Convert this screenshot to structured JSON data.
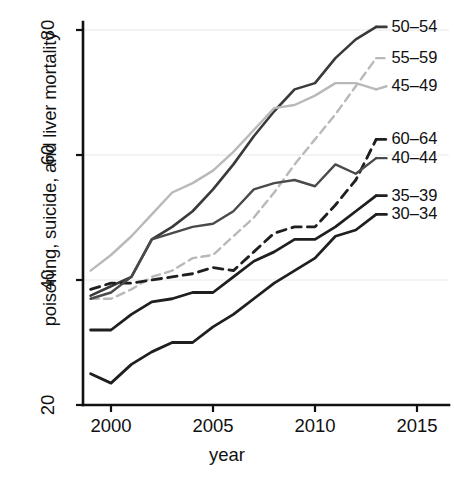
{
  "chart_data": {
    "type": "line",
    "title": "",
    "xlabel": "year",
    "ylabel": "poisoning, suicide, and liver mortality",
    "xlim": [
      1998.6,
      2015
    ],
    "ylim": [
      20,
      82
    ],
    "xticks": [
      2000,
      2005,
      2010,
      2015
    ],
    "yticks": [
      20,
      40,
      60,
      80
    ],
    "grid": true,
    "grid_color": "#e8e8e8",
    "legend_position": "right-end-of-line",
    "x": [
      1999,
      2000,
      2001,
      2002,
      2003,
      2004,
      2005,
      2006,
      2007,
      2008,
      2009,
      2010,
      2011,
      2012,
      2013
    ],
    "series": [
      {
        "name": "50-54",
        "label": "50–54",
        "color": "#3a3a3a",
        "style": "solid",
        "width": 2.6,
        "label_x": 2013.6,
        "label_y": 80.5,
        "values": [
          37.5,
          39.0,
          40.5,
          46.5,
          48.5,
          51.0,
          54.5,
          58.5,
          63.0,
          67.0,
          70.5,
          71.5,
          75.5,
          78.5,
          80.5
        ]
      },
      {
        "name": "55-59",
        "label": "55–59",
        "color": "#b9b9b9",
        "style": "dashed",
        "width": 2.4,
        "label_x": 2013.6,
        "label_y": 75.5,
        "values": [
          37.0,
          37.0,
          38.5,
          40.5,
          41.5,
          43.5,
          44.0,
          47.0,
          50.0,
          54.0,
          58.5,
          62.5,
          66.5,
          71.0,
          75.5
        ]
      },
      {
        "name": "45-49",
        "label": "45–49",
        "color": "#b9b9b9",
        "style": "solid",
        "width": 2.4,
        "label_x": 2013.6,
        "label_y": 71.0,
        "values": [
          41.5,
          44.0,
          47.0,
          50.5,
          54.0,
          55.5,
          57.5,
          60.5,
          64.0,
          67.5,
          68.0,
          69.5,
          71.5,
          71.5,
          70.5
        ]
      },
      {
        "name": "60-64",
        "label": "60–64",
        "color": "#1f1f1f",
        "style": "dashed",
        "width": 2.8,
        "label_x": 2013.6,
        "label_y": 62.5,
        "values": [
          38.5,
          39.5,
          39.5,
          40.0,
          40.5,
          41.0,
          42.0,
          41.5,
          44.5,
          47.5,
          48.5,
          48.5,
          52.0,
          56.0,
          62.5
        ]
      },
      {
        "name": "40-44",
        "label": "40–44",
        "color": "#4a4a4a",
        "style": "solid",
        "width": 2.4,
        "label_x": 2013.6,
        "label_y": 59.5,
        "values": [
          37.0,
          38.0,
          40.5,
          46.5,
          47.5,
          48.5,
          49.0,
          51.0,
          54.5,
          55.5,
          56.0,
          55.0,
          58.5,
          57.0,
          59.5
        ]
      },
      {
        "name": "35-39",
        "label": "35–39",
        "color": "#1f1f1f",
        "style": "solid",
        "width": 2.8,
        "label_x": 2013.6,
        "label_y": 53.5,
        "values": [
          32.0,
          32.0,
          34.5,
          36.5,
          37.0,
          38.0,
          38.0,
          40.5,
          43.0,
          44.5,
          46.5,
          46.5,
          48.5,
          51.0,
          53.5
        ]
      },
      {
        "name": "30-34",
        "label": "30–34",
        "color": "#1f1f1f",
        "style": "solid",
        "width": 2.8,
        "label_x": 2013.6,
        "label_y": 50.5,
        "values": [
          25.0,
          23.5,
          26.5,
          28.5,
          30.0,
          30.0,
          32.5,
          34.5,
          37.0,
          39.5,
          41.5,
          43.5,
          47.0,
          48.0,
          50.5
        ]
      }
    ]
  },
  "axes": {
    "y_label": "poisoning, suicide, and liver mortality",
    "x_label": "year",
    "y_tick_labels": [
      "20",
      "40",
      "60",
      "80"
    ],
    "x_tick_labels": [
      "2000",
      "2005",
      "2010",
      "2015"
    ]
  }
}
